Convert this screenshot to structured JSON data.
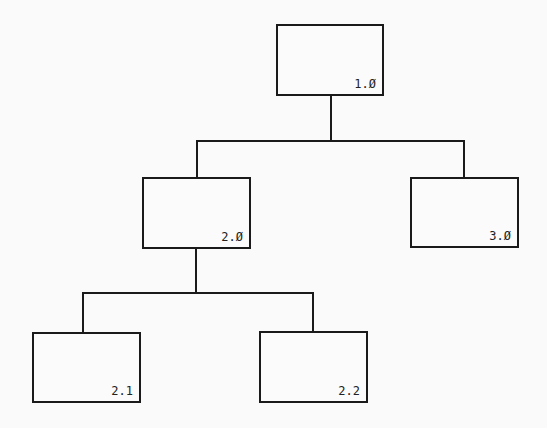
{
  "diagram": {
    "type": "hierarchy-chart",
    "nodes": [
      {
        "id": "1.0",
        "label": "1.Ø",
        "parent": null
      },
      {
        "id": "2.0",
        "label": "2.Ø",
        "parent": "1.0"
      },
      {
        "id": "3.0",
        "label": "3.Ø",
        "parent": "1.0"
      },
      {
        "id": "2.1",
        "label": "2.1",
        "parent": "2.0"
      },
      {
        "id": "2.2",
        "label": "2.2",
        "parent": "2.0"
      }
    ]
  }
}
